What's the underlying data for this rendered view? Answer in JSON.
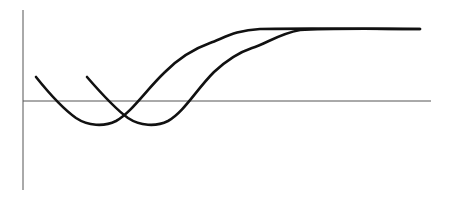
{
  "chart_data": {
    "type": "line",
    "title": "",
    "xlabel": "",
    "ylabel": "",
    "grid": false,
    "legend": null,
    "axes": {
      "y_axis": {
        "x": 23,
        "y1": 10,
        "y2": 190
      },
      "x_axis": {
        "y": 101,
        "x1": 23,
        "x2": 431
      }
    },
    "series": [
      {
        "name": "curve-1",
        "color": "#111111",
        "path": "M36,77 C48,92 62,108 76,118 C88,126 104,127 116,121 C132,112 146,90 165,72 C180,57 196,48 210,43 C224,38 236,30 260,29 C300,28 380,29 420,29"
      },
      {
        "name": "curve-2",
        "color": "#111111",
        "path": "M87,77 C100,92 114,108 128,118 C140,126 156,127 168,121 C184,112 196,90 214,72 C228,59 240,52 252,48 C266,44 278,34 300,30 C330,28 380,29 420,29"
      }
    ]
  }
}
